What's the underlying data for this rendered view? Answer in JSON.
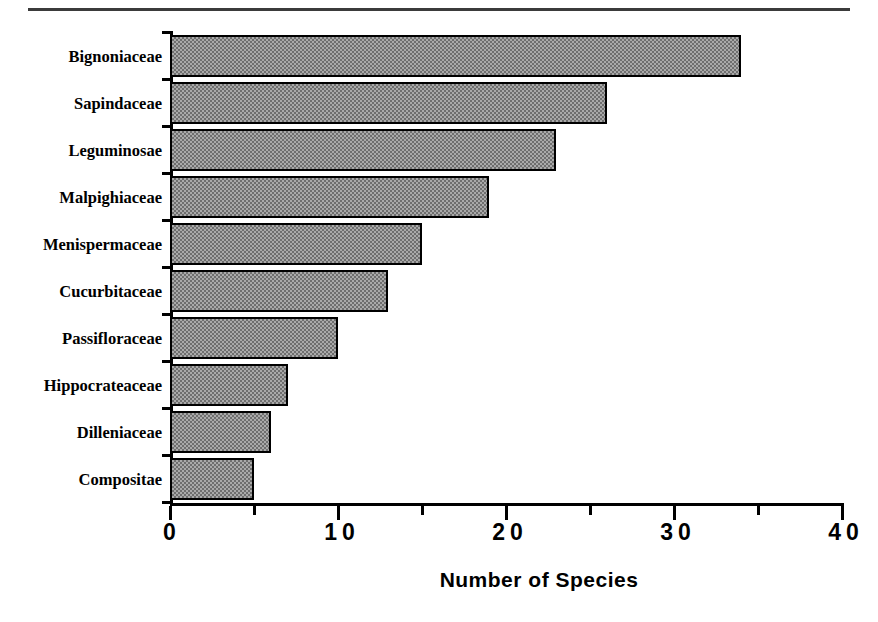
{
  "chart_data": {
    "type": "bar",
    "orientation": "horizontal",
    "title": "",
    "xlabel": "Number of Species",
    "ylabel": "",
    "categories": [
      "Bignoniaceae",
      "Sapindaceae",
      "Leguminosae",
      "Malpighiaceae",
      "Menispermaceae",
      "Cucurbitaceae",
      "Passifloraceae",
      "Hippocrateaceae",
      "Dilleniaceae",
      "Compositae"
    ],
    "values": [
      34,
      26,
      23,
      19,
      15,
      13,
      10,
      7,
      6,
      5
    ],
    "xlim": [
      0,
      40
    ],
    "xticks": [
      0,
      10,
      20,
      30,
      40
    ],
    "xtick_labels": [
      "0",
      "10",
      "20",
      "30",
      "40"
    ],
    "xminor_ticks": [
      5,
      15,
      25,
      35
    ],
    "grid": false,
    "legend": null,
    "bar_fill": "#a9a9a9",
    "bar_pattern": "checkerboard-dither",
    "bar_edge_color": "#000000",
    "axis_color": "#000000"
  },
  "figure": {
    "top_rule_color": "#3b3b3b",
    "background": "#ffffff"
  }
}
